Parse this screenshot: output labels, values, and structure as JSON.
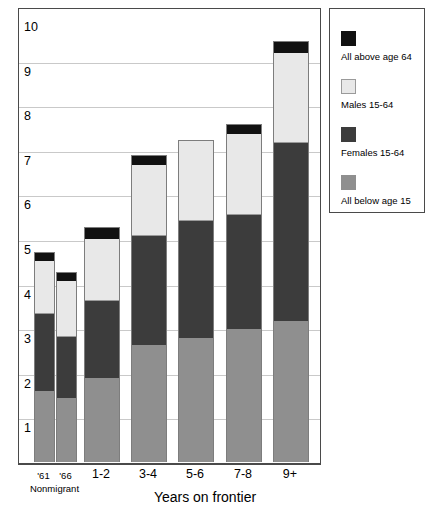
{
  "chart_data": {
    "type": "bar",
    "subtype": "stacked-vertical",
    "title": "",
    "subtitle": "",
    "xlabel": "Years on frontier",
    "ylabel": "",
    "ylim": [
      0,
      10
    ],
    "yticks": [
      1,
      2,
      3,
      4,
      5,
      6,
      7,
      8,
      9,
      10
    ],
    "ytick_labels": [
      "1",
      "2",
      "3",
      "4",
      "5",
      "6",
      "7",
      "8",
      "9",
      "10"
    ],
    "grid": true,
    "grid_axis": "y",
    "legend_position": "right-outside",
    "categories": [
      "'61",
      "'66",
      "1-2",
      "3-4",
      "5-6",
      "7-8",
      "9+"
    ],
    "category_group_label": "Nonmigrant",
    "category_group_members": [
      "'61",
      "'66"
    ],
    "series": [
      {
        "name": "All below age 15",
        "color": "#8f8f8f",
        "values": [
          1.59,
          1.45,
          1.9,
          2.64,
          2.8,
          2.98,
          3.18
        ]
      },
      {
        "name": "Females 15-64",
        "color": "#3c3c3c",
        "values": [
          1.74,
          1.36,
          1.72,
          2.44,
          2.62,
          2.57,
          3.98
        ]
      },
      {
        "name": "Males 15-64",
        "color": "#e8e8e8",
        "values": [
          1.19,
          1.27,
          1.41,
          1.61,
          1.81,
          1.83,
          2.04
        ]
      },
      {
        "name": "All above age 64",
        "color": "#111111",
        "values": [
          0.18,
          0.18,
          0.25,
          0.2,
          0.0,
          0.2,
          0.25
        ]
      }
    ],
    "totals": [
      4.7,
      4.26,
      5.28,
      6.89,
      7.23,
      7.58,
      9.45
    ]
  },
  "axes": {
    "y_tick_labels": [
      "10",
      "9",
      "8",
      "7",
      "6",
      "5",
      "4",
      "3",
      "2",
      "1"
    ],
    "x_tick_labels": [
      "'61",
      "'66",
      "1-2",
      "3-4",
      "5-6",
      "7-8",
      "9+"
    ],
    "x_group_label": "Nonmigrant",
    "x_axis_title": "Years on frontier"
  },
  "legend": {
    "entries": [
      {
        "label": "All above age 64",
        "swatch": "above64"
      },
      {
        "label": "Males 15-64",
        "swatch": "males"
      },
      {
        "label": "Females 15-64",
        "swatch": "females"
      },
      {
        "label": "All below age 15",
        "swatch": "below15"
      }
    ]
  },
  "colors": {
    "above64": "#111111",
    "males": "#e8e8e8",
    "females": "#3c3c3c",
    "below15": "#8f8f8f",
    "grid": "#c9c9c9",
    "frame": "#4a4a4a"
  }
}
